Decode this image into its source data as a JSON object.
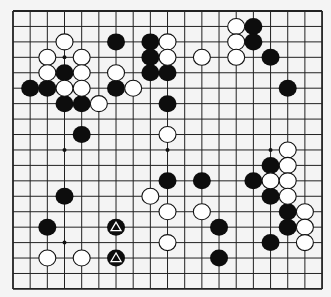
{
  "board": {
    "size": 19,
    "origin_x": 13,
    "origin_y": 11,
    "spacing_x": 17.17,
    "spacing_y": 15.44,
    "background_color": "#f4f4f4",
    "line_color": "#222222",
    "star_points": [
      [
        3,
        3
      ],
      [
        3,
        9
      ],
      [
        9,
        9
      ],
      [
        15,
        9
      ],
      [
        3,
        15
      ]
    ],
    "stone_radius_x": 9,
    "stone_radius_y": 8.5
  },
  "stones": {
    "black": [
      [
        6,
        2
      ],
      [
        8,
        2
      ],
      [
        8,
        3
      ],
      [
        3,
        4
      ],
      [
        8,
        4
      ],
      [
        9,
        4
      ],
      [
        1,
        5
      ],
      [
        2,
        5
      ],
      [
        6,
        5
      ],
      [
        3,
        6
      ],
      [
        4,
        6
      ],
      [
        9,
        6
      ],
      [
        14,
        1
      ],
      [
        14,
        2
      ],
      [
        15,
        3
      ],
      [
        16,
        5
      ],
      [
        4,
        8
      ],
      [
        15,
        10
      ],
      [
        9,
        11
      ],
      [
        11,
        11
      ],
      [
        14,
        11
      ],
      [
        15,
        12
      ],
      [
        3,
        12
      ],
      [
        16,
        13
      ],
      [
        2,
        14
      ],
      [
        12,
        14
      ],
      [
        16,
        14
      ],
      [
        15,
        15
      ],
      [
        12,
        16
      ],
      [
        6,
        14
      ],
      [
        6,
        16
      ]
    ],
    "white": [
      [
        3,
        2
      ],
      [
        9,
        2
      ],
      [
        2,
        3
      ],
      [
        4,
        3
      ],
      [
        9,
        3
      ],
      [
        11,
        3
      ],
      [
        2,
        4
      ],
      [
        4,
        4
      ],
      [
        6,
        4
      ],
      [
        3,
        5
      ],
      [
        4,
        5
      ],
      [
        7,
        5
      ],
      [
        5,
        6
      ],
      [
        13,
        1
      ],
      [
        13,
        2
      ],
      [
        13,
        3
      ],
      [
        9,
        8
      ],
      [
        16,
        9
      ],
      [
        16,
        10
      ],
      [
        15,
        11
      ],
      [
        16,
        11
      ],
      [
        16,
        12
      ],
      [
        8,
        12
      ],
      [
        9,
        13
      ],
      [
        11,
        13
      ],
      [
        17,
        13
      ],
      [
        17,
        14
      ],
      [
        17,
        15
      ],
      [
        9,
        15
      ],
      [
        2,
        16
      ],
      [
        4,
        16
      ]
    ]
  },
  "markers": [
    {
      "type": "triangle",
      "point": [
        6,
        14
      ],
      "on": "black"
    },
    {
      "type": "triangle",
      "point": [
        6,
        16
      ],
      "on": "black"
    }
  ]
}
